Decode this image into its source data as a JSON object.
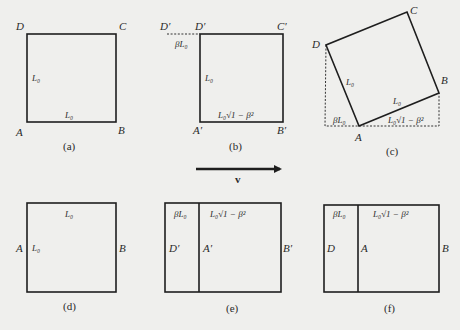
{
  "panels": {
    "a": {
      "caption": "(a)",
      "corners": {
        "A": "A",
        "B": "B",
        "C": "C",
        "D": "D"
      },
      "side_left": "L₀",
      "side_bottom": "L₀"
    },
    "b": {
      "caption": "(b)",
      "corners": {
        "A": "A′",
        "B": "B′",
        "C": "C′",
        "D": "D′",
        "D_shifted": "D′"
      },
      "offset": "βL₀",
      "side_left": "L₀",
      "side_bottom": "L₀√1 − β²"
    },
    "c": {
      "caption": "(c)",
      "corners": {
        "A": "A",
        "B": "B",
        "C": "C",
        "D": "D"
      },
      "side_left": "L₀",
      "side_bottom": "L₀",
      "proj_left": "βL₀",
      "proj_right": "L₀√1 − β²"
    },
    "velocity": {
      "label": "v"
    },
    "d": {
      "caption": "(d)",
      "edge_left": "A",
      "edge_right": "B",
      "side_top": "L₀",
      "side_left": "L₀"
    },
    "e": {
      "caption": "(e)",
      "edge_left": "D′",
      "edge_mid": "A′",
      "edge_right": "B′",
      "top_left": "βL₀",
      "top_right": "L₀√1 − β²"
    },
    "f": {
      "caption": "(f)",
      "edge_left": "D",
      "edge_mid": "A",
      "edge_right": "B",
      "top_left": "βL₀",
      "top_right": "L₀√1 − β²"
    }
  }
}
